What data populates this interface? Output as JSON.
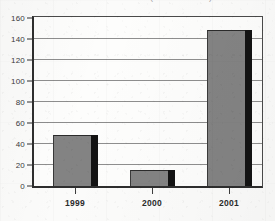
{
  "chart_data": {
    "type": "bar",
    "subtitle": "",
    "xlabel": "",
    "ylabel": "",
    "categories": [
      "1999",
      "2000",
      "2001"
    ],
    "values": [
      48,
      15,
      148
    ],
    "series": [
      {
        "name": "Annual total",
        "values": [
          48,
          15,
          148
        ]
      }
    ],
    "ylim": [
      0,
      160
    ],
    "ytick_labels": [
      "0",
      "20",
      "40",
      "60",
      "80",
      "100",
      "120",
      "140",
      "160"
    ],
    "ytick_values": [
      0,
      20,
      40,
      60,
      80,
      100,
      120,
      140,
      160
    ],
    "grid": true,
    "legend": "none",
    "bar_fill_color": "#838383",
    "bar_shadow_color": "#131313",
    "gridline_color": "#8e8e8e",
    "axis_color": "#2e2e2e",
    "background_color": "#fbfbfa"
  },
  "axes": {
    "y_labels": [
      "160",
      "140",
      "120",
      "100",
      "80",
      "60",
      "40",
      "20",
      "0"
    ],
    "x_labels": [
      "1999",
      "2000",
      "2001"
    ]
  },
  "title_remnant": {
    "text": "(………………)"
  }
}
